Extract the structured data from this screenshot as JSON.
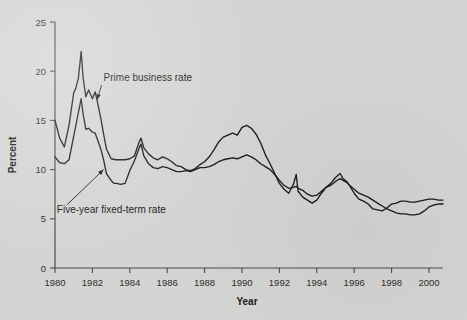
{
  "chart_data": {
    "type": "line",
    "title": "",
    "xlabel": "Year",
    "ylabel": "Percent",
    "xlim": [
      1980,
      2000.75
    ],
    "ylim": [
      0,
      25
    ],
    "xticks": [
      1980,
      1982,
      1984,
      1986,
      1988,
      1990,
      1992,
      1994,
      1996,
      1998,
      2000
    ],
    "yticks": [
      0,
      5,
      10,
      15,
      20,
      25
    ],
    "xticklabels": [
      "1980",
      "1982",
      "1984",
      "1986",
      "1988",
      "1990",
      "1992",
      "1994",
      "1996",
      "1998",
      "2000"
    ],
    "yticklabels": [
      "0",
      "5",
      "10",
      "15",
      "20",
      "25"
    ],
    "grid": false,
    "legend_position": "annotations",
    "series": [
      {
        "name": "Prime business rate",
        "color": "#1c1c1c",
        "x": [
          1980.0,
          1980.25,
          1980.5,
          1980.75,
          1981.0,
          1981.1,
          1981.25,
          1981.4,
          1981.5,
          1981.65,
          1981.8,
          1982.0,
          1982.15,
          1982.3,
          1982.45,
          1982.6,
          1982.75,
          1983.0,
          1983.25,
          1983.5,
          1983.75,
          1984.0,
          1984.25,
          1984.5,
          1984.6,
          1984.75,
          1985.0,
          1985.25,
          1985.5,
          1985.75,
          1986.0,
          1986.25,
          1986.5,
          1986.75,
          1987.0,
          1987.25,
          1987.5,
          1987.75,
          1988.0,
          1988.25,
          1988.5,
          1988.75,
          1989.0,
          1989.25,
          1989.5,
          1989.75,
          1990.0,
          1990.25,
          1990.5,
          1990.75,
          1991.0,
          1991.25,
          1991.5,
          1991.75,
          1992.0,
          1992.25,
          1992.5,
          1992.75,
          1992.9,
          1993.0,
          1993.25,
          1993.5,
          1993.75,
          1994.0,
          1994.25,
          1994.5,
          1994.75,
          1995.0,
          1995.25,
          1995.4,
          1995.6,
          1995.75,
          1996.0,
          1996.25,
          1996.5,
          1996.75,
          1997.0,
          1997.25,
          1997.5,
          1997.75,
          1998.0,
          1998.25,
          1998.5,
          1998.75,
          1999.0,
          1999.25,
          1999.5,
          1999.75,
          2000.0,
          2000.25,
          2000.5,
          2000.75
        ],
        "y": [
          15.0,
          13.2,
          12.3,
          14.5,
          17.8,
          18.2,
          19.3,
          22.0,
          19.4,
          17.4,
          18.1,
          17.2,
          17.9,
          16.6,
          15.2,
          13.6,
          12.1,
          11.1,
          11.0,
          11.0,
          11.0,
          11.1,
          11.4,
          12.8,
          13.2,
          12.2,
          11.6,
          11.2,
          11.0,
          11.3,
          11.1,
          10.8,
          10.4,
          10.3,
          10.0,
          9.9,
          10.1,
          10.5,
          10.8,
          11.3,
          12.0,
          12.8,
          13.3,
          13.5,
          13.7,
          13.5,
          14.3,
          14.5,
          14.2,
          13.6,
          12.7,
          11.5,
          10.6,
          9.6,
          8.6,
          8.0,
          7.6,
          8.5,
          9.5,
          7.8,
          7.2,
          6.9,
          6.6,
          6.9,
          7.6,
          8.2,
          8.6,
          9.2,
          9.6,
          9.1,
          8.8,
          8.4,
          7.6,
          7.0,
          6.8,
          6.5,
          6.0,
          5.9,
          5.8,
          6.1,
          6.5,
          6.6,
          6.8,
          6.8,
          6.7,
          6.7,
          6.8,
          6.9,
          7.0,
          7.0,
          6.9,
          6.9
        ]
      },
      {
        "name": "Five-year fixed-term rate",
        "color": "#1c1c1c",
        "x": [
          1980.0,
          1980.25,
          1980.5,
          1980.75,
          1981.0,
          1981.25,
          1981.4,
          1981.5,
          1981.65,
          1981.8,
          1982.0,
          1982.15,
          1982.3,
          1982.45,
          1982.6,
          1982.75,
          1983.0,
          1983.15,
          1983.3,
          1983.5,
          1983.75,
          1984.0,
          1984.25,
          1984.5,
          1984.6,
          1984.75,
          1985.0,
          1985.25,
          1985.5,
          1985.75,
          1986.0,
          1986.25,
          1986.5,
          1986.75,
          1987.0,
          1987.25,
          1987.5,
          1987.75,
          1988.0,
          1988.25,
          1988.5,
          1988.75,
          1989.0,
          1989.25,
          1989.5,
          1989.75,
          1990.0,
          1990.25,
          1990.5,
          1990.75,
          1991.0,
          1991.25,
          1991.5,
          1991.75,
          1992.0,
          1992.25,
          1992.5,
          1992.75,
          1992.9,
          1993.0,
          1993.25,
          1993.5,
          1993.75,
          1994.0,
          1994.25,
          1994.5,
          1994.75,
          1995.0,
          1995.25,
          1995.4,
          1995.6,
          1995.75,
          1996.0,
          1996.25,
          1996.5,
          1996.75,
          1997.0,
          1997.25,
          1997.5,
          1997.75,
          1998.0,
          1998.25,
          1998.5,
          1998.75,
          1999.0,
          1999.25,
          1999.5,
          1999.75,
          2000.0,
          2000.25,
          2000.5,
          2000.75
        ],
        "y": [
          11.3,
          10.7,
          10.6,
          11.0,
          13.4,
          15.8,
          17.2,
          15.7,
          14.1,
          14.2,
          13.8,
          13.7,
          12.9,
          12.1,
          11.0,
          9.6,
          8.9,
          8.6,
          8.6,
          8.5,
          8.6,
          9.9,
          10.9,
          12.2,
          12.6,
          11.4,
          10.6,
          10.2,
          10.1,
          10.3,
          10.2,
          10.0,
          9.8,
          9.8,
          9.9,
          9.8,
          10.0,
          10.2,
          10.2,
          10.3,
          10.5,
          10.8,
          11.0,
          11.1,
          11.2,
          11.1,
          11.3,
          11.5,
          11.3,
          11.0,
          10.6,
          10.3,
          10.0,
          9.5,
          8.9,
          8.4,
          8.1,
          8.2,
          8.3,
          8.1,
          7.9,
          7.5,
          7.3,
          7.4,
          7.8,
          8.2,
          8.4,
          8.8,
          9.1,
          8.9,
          8.7,
          8.4,
          8.0,
          7.6,
          7.4,
          7.2,
          6.9,
          6.6,
          6.3,
          6.0,
          5.8,
          5.6,
          5.5,
          5.5,
          5.4,
          5.4,
          5.5,
          5.8,
          6.2,
          6.4,
          6.5,
          6.5
        ]
      }
    ],
    "annotations": [
      {
        "text": "Prime business rate",
        "text_x": 1982.6,
        "text_y": 19.0,
        "arrow_to_x": 1982.25,
        "arrow_to_y": 17.1
      },
      {
        "text": "Five-year fixed-term rate",
        "text_x": 1980.1,
        "text_y": 5.6,
        "arrow_to_x": 1982.6,
        "arrow_to_y": 10.0
      }
    ]
  }
}
